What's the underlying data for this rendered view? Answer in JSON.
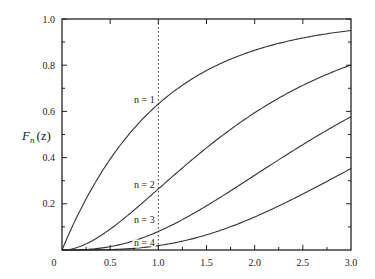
{
  "chart_data": {
    "type": "line",
    "title": "",
    "xlabel": "",
    "ylabel": "F_n(z)",
    "ylabel_main": "F",
    "ylabel_sub": "n",
    "ylabel_arg": "(z)",
    "xlim": [
      0,
      3.0
    ],
    "ylim": [
      0,
      1.0
    ],
    "grid": false,
    "legend": "inline curve labels",
    "x_ticks": [
      0.5,
      1.0,
      1.5,
      2.0,
      2.5,
      3.0
    ],
    "x_tick_labels": [
      "0.5",
      "1.0",
      "1.5",
      "2.0",
      "2.5",
      "3.0"
    ],
    "y_ticks": [
      0.2,
      0.4,
      0.6,
      0.8,
      1.0
    ],
    "y_tick_labels": [
      "0.2",
      "0.4",
      "0.6",
      "0.8",
      "1.0"
    ],
    "origin_label": "0",
    "reference_line": {
      "x": 1.0,
      "style": "dotted"
    },
    "x": [
      0,
      0.25,
      0.5,
      0.75,
      1.0,
      1.25,
      1.5,
      1.75,
      2.0,
      2.25,
      2.5,
      2.75,
      3.0
    ],
    "series": [
      {
        "name": "n = 1",
        "values": [
          0,
          0.221,
          0.393,
          0.528,
          0.632,
          0.713,
          0.777,
          0.826,
          0.865,
          0.895,
          0.918,
          0.936,
          0.95
        ]
      },
      {
        "name": "n = 2",
        "values": [
          0,
          0.026,
          0.09,
          0.173,
          0.264,
          0.355,
          0.442,
          0.522,
          0.594,
          0.657,
          0.713,
          0.76,
          0.801
        ]
      },
      {
        "name": "n = 3",
        "values": [
          0,
          0.002,
          0.014,
          0.041,
          0.08,
          0.132,
          0.191,
          0.256,
          0.323,
          0.391,
          0.456,
          0.518,
          0.577
        ]
      },
      {
        "name": "n = 4",
        "values": [
          0,
          0.0001,
          0.002,
          0.007,
          0.019,
          0.039,
          0.066,
          0.101,
          0.143,
          0.191,
          0.242,
          0.297,
          0.353
        ]
      }
    ],
    "curve_labels": [
      {
        "text": "n = 1",
        "x_px": 134,
        "y_px": 103
      },
      {
        "text": "n = 2",
        "x_px": 134,
        "y_px": 188
      },
      {
        "text": "n = 3",
        "x_px": 134,
        "y_px": 223
      },
      {
        "text": "n = 4",
        "x_px": 134,
        "y_px": 246
      }
    ]
  }
}
